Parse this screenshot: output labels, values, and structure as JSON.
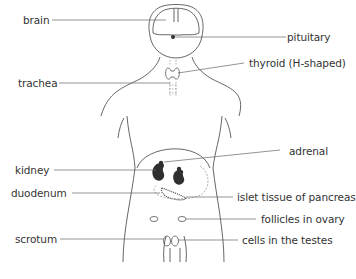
{
  "diagram": {
    "labels_left": [
      {
        "id": "brain",
        "text": "brain"
      },
      {
        "id": "trachea",
        "text": "trachea"
      },
      {
        "id": "kidney",
        "text": "kidney"
      },
      {
        "id": "duodenum",
        "text": "duodenum"
      },
      {
        "id": "scrotum",
        "text": "scrotum"
      }
    ],
    "labels_right": [
      {
        "id": "pituitary",
        "text": "pituitary"
      },
      {
        "id": "thyroid",
        "text": "thyroid (H-shaped)"
      },
      {
        "id": "adrenal",
        "text": "adrenal"
      },
      {
        "id": "islet",
        "text": "islet tissue of pancreas"
      },
      {
        "id": "follicles",
        "text": "follicles in ovary"
      },
      {
        "id": "testes",
        "text": "cells in the testes"
      }
    ],
    "colors": {
      "outline": "#555555",
      "organ_fill": "#2f2f2f",
      "leader_line": "#666666",
      "text": "#333333"
    }
  }
}
